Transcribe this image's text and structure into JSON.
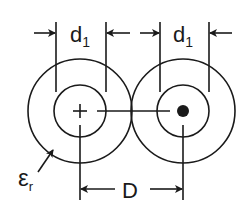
{
  "diagram": {
    "labels": {
      "d1_left": "d",
      "d1_left_sub": "1",
      "d1_right": "d",
      "d1_right_sub": "1",
      "spacing": "D",
      "permittivity": "ε",
      "permittivity_sub": "r"
    },
    "conductors": [
      {
        "name": "left",
        "marker": "plus",
        "cx": 80,
        "cy": 111
      },
      {
        "name": "right",
        "marker": "dot",
        "cx": 183,
        "cy": 111
      }
    ],
    "colors": {
      "stroke": "#1a1a1a",
      "background": "#ffffff"
    }
  }
}
